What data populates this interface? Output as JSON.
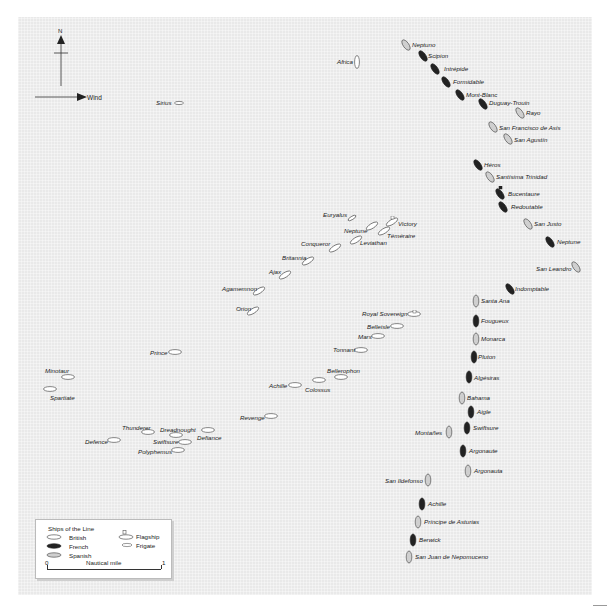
{
  "map": {
    "compass_label": "N",
    "wind_label": "Wind",
    "british_ships": [
      {
        "name": "Africa",
        "x": 357,
        "y": 62,
        "lx": 337,
        "ly": 59,
        "orient": "v"
      },
      {
        "name": "Sirius",
        "x": 179,
        "y": 103,
        "lx": 156,
        "ly": 100,
        "orient": "h",
        "frigate": true
      },
      {
        "name": "Euryalus",
        "x": 352,
        "y": 218,
        "lx": 323,
        "ly": 212,
        "orient": "d",
        "frigate": true
      },
      {
        "name": "Victory",
        "x": 392,
        "y": 222,
        "lx": 398,
        "ly": 221,
        "orient": "d",
        "flag": true
      },
      {
        "name": "Neptune",
        "x": 372,
        "y": 226,
        "lx": 344,
        "ly": 228,
        "orient": "d"
      },
      {
        "name": "Téméraire",
        "x": 384,
        "y": 231,
        "lx": 387,
        "ly": 233,
        "orient": "d"
      },
      {
        "name": "Leviathan",
        "x": 356,
        "y": 240,
        "lx": 360,
        "ly": 240,
        "orient": "d"
      },
      {
        "name": "Conqueror",
        "x": 335,
        "y": 248,
        "lx": 301,
        "ly": 241,
        "orient": "d"
      },
      {
        "name": "Britannia",
        "x": 308,
        "y": 261,
        "lx": 282,
        "ly": 255,
        "orient": "d"
      },
      {
        "name": "Ajax",
        "x": 285,
        "y": 275,
        "lx": 269,
        "ly": 269,
        "orient": "d"
      },
      {
        "name": "Agamemnon",
        "x": 259,
        "y": 291,
        "lx": 222,
        "ly": 286,
        "orient": "d"
      },
      {
        "name": "Orion",
        "x": 253,
        "y": 311,
        "lx": 236,
        "ly": 306,
        "orient": "d"
      },
      {
        "name": "Royal Sovereign",
        "x": 414,
        "y": 314,
        "lx": 362,
        "ly": 311,
        "orient": "h",
        "flag": true
      },
      {
        "name": "Belleisle",
        "x": 397,
        "y": 326,
        "lx": 367,
        "ly": 324,
        "orient": "h"
      },
      {
        "name": "Mars",
        "x": 378,
        "y": 336,
        "lx": 358,
        "ly": 334,
        "orient": "h"
      },
      {
        "name": "Tonnant",
        "x": 361,
        "y": 350,
        "lx": 333,
        "ly": 347,
        "orient": "h"
      },
      {
        "name": "Prince",
        "x": 175,
        "y": 352,
        "lx": 150,
        "ly": 350,
        "orient": "h"
      },
      {
        "name": "Bellerophon",
        "x": 341,
        "y": 377,
        "lx": 327,
        "ly": 368,
        "orient": "h"
      },
      {
        "name": "Minotaur",
        "x": 68,
        "y": 377,
        "lx": 45,
        "ly": 368,
        "orient": "h"
      },
      {
        "name": "Colossus",
        "x": 319,
        "y": 380,
        "lx": 305,
        "ly": 387,
        "orient": "h"
      },
      {
        "name": "Achille",
        "x": 295,
        "y": 385,
        "lx": 269,
        "ly": 383,
        "orient": "h"
      },
      {
        "name": "Spartiate",
        "x": 50,
        "y": 389,
        "lx": 50,
        "ly": 395,
        "orient": "h"
      },
      {
        "name": "Revenge",
        "x": 271,
        "y": 416,
        "lx": 240,
        "ly": 415,
        "orient": "h"
      },
      {
        "name": "Defiance",
        "x": 208,
        "y": 430,
        "lx": 197,
        "ly": 435,
        "orient": "h"
      },
      {
        "name": "Thunderer",
        "x": 148,
        "y": 432,
        "lx": 122,
        "ly": 425,
        "orient": "h"
      },
      {
        "name": "Dreadnought",
        "x": 176,
        "y": 435,
        "lx": 160,
        "ly": 427,
        "orient": "h"
      },
      {
        "name": "Defence",
        "x": 114,
        "y": 440,
        "lx": 85,
        "ly": 439,
        "orient": "h"
      },
      {
        "name": "Swiftsure",
        "x": 185,
        "y": 442,
        "lx": 153,
        "ly": 439,
        "orient": "h"
      },
      {
        "name": "Polyphemus",
        "x": 178,
        "y": 450,
        "lx": 138,
        "ly": 449,
        "orient": "h"
      }
    ],
    "french_ships": [
      {
        "name": "Scipion",
        "x": 423,
        "y": 56,
        "lx": 428,
        "ly": 53
      },
      {
        "name": "Intrépide",
        "x": 435,
        "y": 69,
        "lx": 444,
        "ly": 66
      },
      {
        "name": "Formidable",
        "x": 446,
        "y": 82,
        "lx": 453,
        "ly": 79
      },
      {
        "name": "Mont-Blanc",
        "x": 460,
        "y": 95,
        "lx": 466,
        "ly": 92
      },
      {
        "name": "Duguay-Trouin",
        "x": 483,
        "y": 104,
        "lx": 489,
        "ly": 100
      },
      {
        "name": "Héros",
        "x": 478,
        "y": 165,
        "lx": 484,
        "ly": 162
      },
      {
        "name": "Bucentaure",
        "x": 500,
        "y": 194,
        "lx": 508,
        "ly": 191,
        "flag": true
      },
      {
        "name": "Redoutable",
        "x": 503,
        "y": 207,
        "lx": 511,
        "ly": 204
      },
      {
        "name": "Neptune",
        "x": 550,
        "y": 242,
        "lx": 557,
        "ly": 239
      },
      {
        "name": "Indomptable",
        "x": 510,
        "y": 289,
        "lx": 515,
        "ly": 286
      },
      {
        "name": "Fougueux",
        "x": 476,
        "y": 321,
        "lx": 481,
        "ly": 318
      },
      {
        "name": "Pluton",
        "x": 474,
        "y": 357,
        "lx": 478,
        "ly": 354
      },
      {
        "name": "Algésiras",
        "x": 469,
        "y": 377,
        "lx": 474,
        "ly": 375
      },
      {
        "name": "Aigle",
        "x": 471,
        "y": 412,
        "lx": 477,
        "ly": 409
      },
      {
        "name": "Swiftsure",
        "x": 467,
        "y": 428,
        "lx": 473,
        "ly": 425
      },
      {
        "name": "Argonaute",
        "x": 463,
        "y": 451,
        "lx": 469,
        "ly": 448
      },
      {
        "name": "Achille",
        "x": 422,
        "y": 504,
        "lx": 428,
        "ly": 501
      },
      {
        "name": "Berwick",
        "x": 413,
        "y": 540,
        "lx": 419,
        "ly": 537
      }
    ],
    "spanish_ships": [
      {
        "name": "Neptuno",
        "x": 406,
        "y": 45,
        "lx": 412,
        "ly": 42
      },
      {
        "name": "Rayo",
        "x": 520,
        "y": 113,
        "lx": 526,
        "ly": 110
      },
      {
        "name": "San Francisco de Asís",
        "x": 493,
        "y": 127,
        "lx": 499,
        "ly": 125
      },
      {
        "name": "San Agustín",
        "x": 508,
        "y": 139,
        "lx": 514,
        "ly": 137
      },
      {
        "name": "Santísima Trinidad",
        "x": 490,
        "y": 177,
        "lx": 496,
        "ly": 174
      },
      {
        "name": "San Justo",
        "x": 528,
        "y": 224,
        "lx": 534,
        "ly": 221
      },
      {
        "name": "San Leandro",
        "x": 576,
        "y": 267,
        "lx": 536,
        "ly": 266
      },
      {
        "name": "Santa Ana",
        "x": 476,
        "y": 301,
        "lx": 481,
        "ly": 298
      },
      {
        "name": "Monarca",
        "x": 476,
        "y": 339,
        "lx": 481,
        "ly": 336
      },
      {
        "name": "Bahama",
        "x": 462,
        "y": 398,
        "lx": 467,
        "ly": 395
      },
      {
        "name": "Montañes",
        "x": 449,
        "y": 432,
        "lx": 415,
        "ly": 430
      },
      {
        "name": "Argonauta",
        "x": 468,
        "y": 471,
        "lx": 474,
        "ly": 468
      },
      {
        "name": "San Ildefonso",
        "x": 428,
        "y": 480,
        "lx": 385,
        "ly": 478
      },
      {
        "name": "Príncipe de Asturias",
        "x": 418,
        "y": 522,
        "lx": 424,
        "ly": 519
      },
      {
        "name": "San Juan de Nepomuceno",
        "x": 409,
        "y": 557,
        "lx": 415,
        "ly": 554
      }
    ]
  },
  "legend": {
    "title": "Ships of the Line",
    "british": "British",
    "french": "French",
    "spanish": "Spanish",
    "flagship": "Flagship",
    "frigate": "Frigate",
    "scale_start": "0",
    "scale_label": "Nautical mile",
    "scale_end": "1"
  },
  "colors": {
    "sea": "#e9e9e9",
    "british_fill": "#ffffff",
    "french_fill": "#222222",
    "spanish_fill": "#cfcfcf",
    "outline": "#555555"
  }
}
